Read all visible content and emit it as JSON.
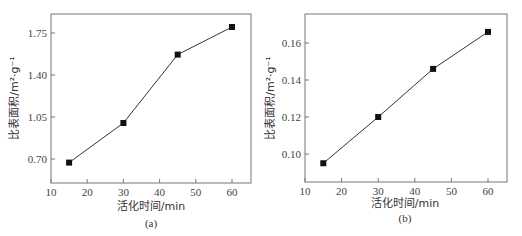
{
  "chart_data": [
    {
      "type": "line",
      "panel": "(a)",
      "title": "",
      "xlabel": "活化时间/min",
      "ylabel": "比表面积/m²·g⁻¹",
      "x": [
        15,
        30,
        45,
        60
      ],
      "series": [
        {
          "name": "",
          "values": [
            0.67,
            1.0,
            1.57,
            1.8
          ],
          "marker": "square"
        }
      ],
      "xticks": [
        "10",
        "20",
        "30",
        "40",
        "50",
        "60"
      ],
      "yticks": [
        "0.70",
        "1.05",
        "1.40",
        "1.75"
      ],
      "xlim": [
        10,
        65
      ],
      "ylim": [
        0.5,
        1.9
      ],
      "grid": false,
      "legend": "none"
    },
    {
      "type": "line",
      "panel": "(b)",
      "title": "",
      "xlabel": "活化时间/min",
      "ylabel": "比表面积/m²·g⁻¹",
      "x": [
        15,
        30,
        45,
        60
      ],
      "series": [
        {
          "name": "",
          "values": [
            0.095,
            0.12,
            0.146,
            0.166
          ],
          "marker": "square"
        }
      ],
      "xticks": [
        "10",
        "20",
        "30",
        "40",
        "50",
        "60"
      ],
      "yticks": [
        "0.10",
        "0.12",
        "0.14",
        "0.16"
      ],
      "xlim": [
        10,
        65
      ],
      "ylim": [
        0.085,
        0.175
      ],
      "grid": false,
      "legend": "none"
    }
  ],
  "panels": {
    "a": {
      "caption": "(a)",
      "xlabel": "活化时间/min",
      "ylabel": "比表面积/m²·g⁻¹"
    },
    "b": {
      "caption": "(b)",
      "xlabel": "活化时间/min",
      "ylabel": "比表面积/m²·g⁻¹"
    }
  }
}
